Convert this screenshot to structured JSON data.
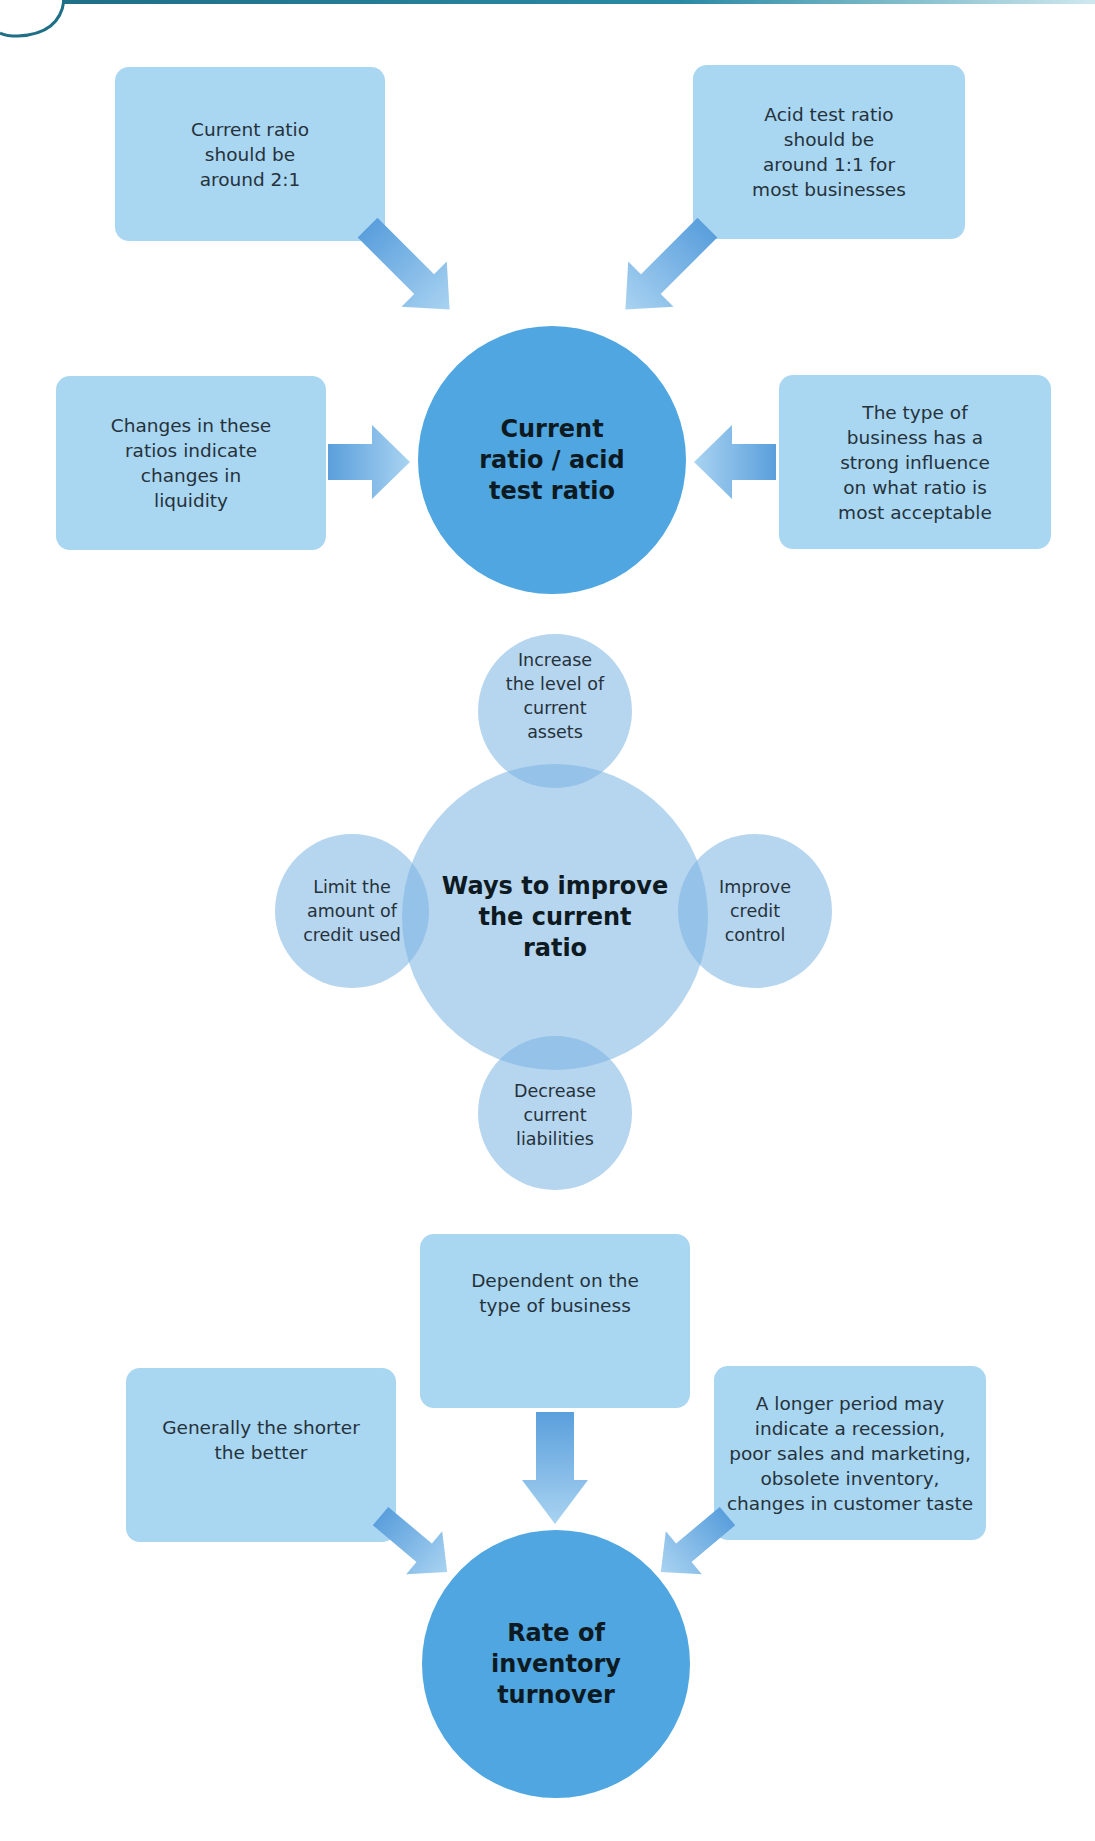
{
  "colors": {
    "box_fill": "#a9d6f1",
    "hub_fill": "#4fa6e0",
    "arrow_fill": "#7ab8e6",
    "bubble_fill": "#9cc4ea",
    "header_rule": "#1f6f86"
  },
  "section1": {
    "hub": "Current\nratio / acid\ntest ratio",
    "boxes": [
      {
        "id": "top-left",
        "text": "Current ratio\nshould be\naround 2:1"
      },
      {
        "id": "top-right",
        "text": "Acid test ratio\nshould be\naround 1:1 for\nmost businesses"
      },
      {
        "id": "left",
        "text": "Changes in these\nratios indicate\nchanges in\nliquidity"
      },
      {
        "id": "right",
        "text": "The type of\nbusiness has a\nstrong influence\non what ratio is\nmost acceptable"
      }
    ]
  },
  "section2": {
    "center": "Ways to improve\nthe current\nratio",
    "bubbles": [
      {
        "id": "top",
        "text": "Increase\nthe level of\ncurrent\nassets"
      },
      {
        "id": "left",
        "text": "Limit the\namount of\ncredit used"
      },
      {
        "id": "right",
        "text": "Improve\ncredit\ncontrol"
      },
      {
        "id": "bottom",
        "text": "Decrease\ncurrent\nliabilities"
      }
    ]
  },
  "section3": {
    "hub": "Rate of\ninventory\nturnover",
    "boxes": [
      {
        "id": "top",
        "text": "Dependent on the\ntype of business"
      },
      {
        "id": "left",
        "text": "Generally the shorter\nthe better"
      },
      {
        "id": "right",
        "text": "A longer period may\nindicate a recession,\npoor sales and marketing,\nobsolete inventory,\nchanges in customer taste"
      }
    ]
  }
}
